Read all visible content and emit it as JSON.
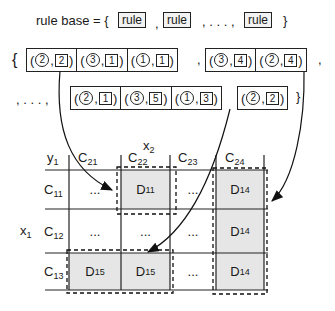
{
  "header": {
    "label": "rule base = {",
    "rule_label": "rule",
    "separator": ",",
    "ellipsis": ", . . . ,",
    "close": "}"
  },
  "rules": {
    "open_brace": "{",
    "close_brace": "}",
    "row1_group1": [
      {
        "circle": "2",
        "square": "2"
      },
      {
        "circle": "3",
        "square": "1"
      },
      {
        "circle": "1",
        "square": "1"
      }
    ],
    "row1_group2": [
      {
        "circle": "3",
        "square": "4"
      },
      {
        "circle": "2",
        "square": "4"
      }
    ],
    "row2_prefix": ", . . . ,",
    "row2_group1": [
      {
        "circle": "2",
        "square": "1"
      },
      {
        "circle": "3",
        "square": "5"
      },
      {
        "circle": "1",
        "square": "3"
      }
    ],
    "row2_group2": [
      {
        "circle": "2",
        "square": "2"
      }
    ]
  },
  "table": {
    "x2_label": "x",
    "x2_sub": "2",
    "y1_label": "y",
    "y1_sub": "1",
    "x1_label": "x",
    "x1_sub": "1",
    "columns": [
      {
        "label": "C",
        "sub": "21"
      },
      {
        "label": "C",
        "sub": "22"
      },
      {
        "label": "C",
        "sub": "23"
      },
      {
        "label": "C",
        "sub": "24"
      }
    ],
    "rows": [
      {
        "label": "C",
        "sub": "11",
        "cells": [
          "...",
          "D11",
          "...",
          "D14"
        ]
      },
      {
        "label": "C",
        "sub": "12",
        "cells": [
          "...",
          "...",
          "...",
          "D14"
        ]
      },
      {
        "label": "C",
        "sub": "13",
        "cells": [
          "D15",
          "D15",
          "...",
          "D14"
        ]
      }
    ],
    "shaded_cells": {
      "r0c1": {
        "main": "D",
        "sub": "11"
      },
      "r0c3": {
        "main": "D",
        "sub": "14"
      },
      "r1c3": {
        "main": "D",
        "sub": "14"
      },
      "r2c0": {
        "main": "D",
        "sub": "15"
      },
      "r2c1": {
        "main": "D",
        "sub": "15"
      },
      "r2c3": {
        "main": "D",
        "sub": "14"
      }
    },
    "ellipsis": "...",
    "shade_color": "#e6e6e6"
  }
}
